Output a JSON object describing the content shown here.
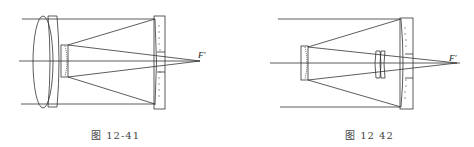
{
  "figures": [
    {
      "id": "fig-12-41",
      "caption": "图 12-41",
      "focus_label": "F′",
      "description": "Catadioptric telescope: doublet corrector lens at front, small convex secondary mirror, concave primary mirror with central hole, focus F′ behind primary"
    },
    {
      "id": "fig-12-42",
      "caption": "图 12 42",
      "focus_label": "F′",
      "description": "Cassegrain-type telescope: small convex secondary mirror, concave primary mirror with central hole, field corrector doublet lens before primary, focus F′ behind primary"
    }
  ],
  "colors": {
    "line": "#333333",
    "background": "#ffffff",
    "caption": "#444444"
  }
}
